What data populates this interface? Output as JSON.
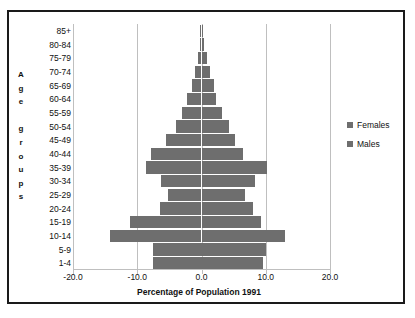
{
  "chart_data": {
    "type": "bar",
    "subtype": "population-pyramid",
    "title": "",
    "xlabel": "Percentage of Population 1991",
    "ylabel": "Age groups",
    "ylabel_letters": [
      "A",
      "g",
      "e",
      "",
      "g",
      "r",
      "o",
      "u",
      "p",
      "s"
    ],
    "categories": [
      "85+",
      "80-84",
      "75-79",
      "70-74",
      "65-69",
      "60-64",
      "55-59",
      "50-54",
      "45-49",
      "40-44",
      "35-39",
      "30-34",
      "25-29",
      "20-24",
      "15-19",
      "10-14",
      "5-9",
      "1-4"
    ],
    "xlim": [
      -20.0,
      20.0
    ],
    "xticks": [
      -20.0,
      -10.0,
      0.0,
      10.0,
      20.0
    ],
    "xtick_labels": [
      "-20.0",
      "-10.0",
      "0.0",
      "10.0",
      "20.0"
    ],
    "grid": true,
    "legend_position": "right",
    "series": [
      {
        "name": "Males",
        "side": "left",
        "color": "#6e6e6e",
        "values": [
          -0.2,
          -0.3,
          -0.6,
          -1.0,
          -1.5,
          -2.3,
          -3.0,
          -4.0,
          -5.5,
          -7.8,
          -8.7,
          -6.3,
          -5.2,
          -6.5,
          -11.2,
          -14.3,
          -7.5,
          -7.5
        ]
      },
      {
        "name": "Females",
        "side": "right",
        "color": "#6e6e6e",
        "values": [
          0.2,
          0.4,
          0.8,
          1.3,
          2.0,
          2.2,
          3.2,
          4.3,
          5.2,
          6.5,
          10.2,
          8.3,
          6.8,
          8.0,
          9.3,
          13.0,
          10.0,
          9.5
        ]
      }
    ]
  },
  "legend": {
    "items": [
      {
        "label": "Females",
        "color": "#6e6e6e"
      },
      {
        "label": "Males",
        "color": "#6e6e6e"
      }
    ]
  },
  "axis": {
    "x_title": "Percentage of Population 1991"
  },
  "colors": {
    "bar": "#6e6e6e",
    "grid": "#bfbfbf",
    "frame": "#1a1a1a",
    "text": "#111111",
    "background": "#ffffff"
  }
}
